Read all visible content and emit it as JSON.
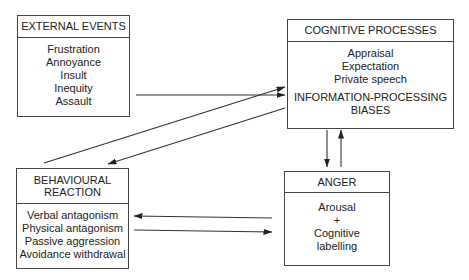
{
  "diagram": {
    "boxes": {
      "external_events": {
        "title": "EXTERNAL EVENTS",
        "items": [
          "Frustration",
          "Annoyance",
          "Insult",
          "Inequity",
          "Assault"
        ]
      },
      "cognitive_processes": {
        "title": "COGNITIVE PROCESSES",
        "items": [
          "Appraisal",
          "Expectation",
          "Private speech"
        ],
        "subheading_line1": "INFORMATION-PROCESSING",
        "subheading_line2": "BIASES"
      },
      "behavioural_reaction": {
        "title_line1": "BEHAVIOURAL",
        "title_line2": "REACTION",
        "items": [
          "Verbal antagonism",
          "Physical antagonism",
          "Passive aggression",
          "Avoidance withdrawal"
        ]
      },
      "anger": {
        "title": "ANGER",
        "items": [
          "Arousal",
          "+",
          "Cognitive",
          "labelling"
        ]
      }
    },
    "arrows": [
      {
        "from": "external_events",
        "to": "cognitive_processes"
      },
      {
        "from": "behavioural_reaction",
        "to": "cognitive_processes"
      },
      {
        "from": "cognitive_processes",
        "to": "behavioural_reaction"
      },
      {
        "from": "cognitive_processes",
        "to": "anger"
      },
      {
        "from": "anger",
        "to": "cognitive_processes"
      },
      {
        "from": "anger",
        "to": "behavioural_reaction"
      },
      {
        "from": "behavioural_reaction",
        "to": "anger"
      }
    ],
    "colors": {
      "line": "#333333",
      "background": "#ffffff"
    }
  }
}
